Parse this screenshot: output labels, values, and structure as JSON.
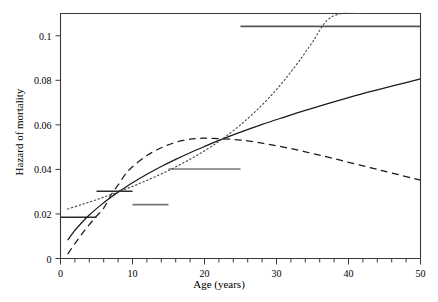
{
  "chart_data": {
    "type": "line",
    "title": "",
    "xlabel": "Age (years)",
    "ylabel": "Hazard of mortality",
    "xlim": [
      0,
      50
    ],
    "ylim": [
      0,
      0.11
    ],
    "grid": false,
    "legend": "none",
    "xticks": [
      0,
      10,
      20,
      30,
      40,
      50
    ],
    "xtick_labels": [
      "0",
      "10",
      "20",
      "30",
      "40",
      "50"
    ],
    "xminor_step": 2,
    "yticks": [
      0,
      0.02,
      0.04,
      0.06,
      0.08,
      0.1
    ],
    "ytick_labels": [
      "0",
      "0.02",
      "0.04",
      "0.06",
      "0.08",
      "0.1"
    ],
    "series": [
      {
        "name": "solid-curve",
        "style": "solid",
        "color": "#1a1a1a",
        "x": [
          1,
          2,
          3,
          4,
          5,
          6,
          7,
          8,
          9,
          10,
          12,
          14,
          16,
          18,
          20,
          22,
          25,
          28,
          31,
          34,
          37,
          40,
          43,
          46,
          50
        ],
        "y": [
          0.0083,
          0.0126,
          0.0163,
          0.0195,
          0.0224,
          0.025,
          0.0275,
          0.0298,
          0.0319,
          0.034,
          0.0378,
          0.0413,
          0.0445,
          0.0475,
          0.0503,
          0.053,
          0.0567,
          0.0602,
          0.0634,
          0.0665,
          0.0694,
          0.0722,
          0.0749,
          0.0774,
          0.0806
        ]
      },
      {
        "name": "dashed-curve",
        "style": "dashed",
        "color": "#1a1a1a",
        "x": [
          1,
          2,
          3,
          4,
          5,
          6,
          7,
          8,
          9,
          10,
          12,
          14,
          16,
          18,
          19,
          20,
          22,
          25,
          28,
          31,
          34,
          37,
          40,
          43,
          46,
          50
        ],
        "y": [
          0.002,
          0.0067,
          0.0111,
          0.0152,
          0.019,
          0.0226,
          0.0285,
          0.033,
          0.0378,
          0.0412,
          0.0462,
          0.0497,
          0.0522,
          0.0536,
          0.0539,
          0.054,
          0.0538,
          0.0532,
          0.0518,
          0.05,
          0.0479,
          0.0456,
          0.0432,
          0.0408,
          0.0384,
          0.0352
        ]
      },
      {
        "name": "dotted-curve",
        "style": "dotted",
        "color": "#4d4d4d",
        "x": [
          1,
          3,
          5,
          7,
          9,
          11,
          13,
          15,
          17,
          19,
          21,
          23,
          25,
          27,
          29,
          31,
          33,
          35,
          37,
          39,
          41,
          42
        ],
        "y": [
          0.0222,
          0.0243,
          0.0264,
          0.0287,
          0.0311,
          0.0337,
          0.0365,
          0.0395,
          0.0428,
          0.0464,
          0.0504,
          0.0549,
          0.06,
          0.0658,
          0.0723,
          0.0797,
          0.088,
          0.0972,
          0.1069,
          0.11,
          0.11,
          0.11
        ]
      }
    ],
    "step_segments": [
      {
        "name": "step-0-5",
        "x0": 0,
        "x1": 5,
        "y": 0.0185,
        "color": "#2b2b2b"
      },
      {
        "name": "step-5-10",
        "x0": 5,
        "x1": 10,
        "y": 0.0302,
        "color": "#2b2b2b"
      },
      {
        "name": "step-10-15",
        "x0": 10,
        "x1": 15,
        "y": 0.0242,
        "color": "#777777"
      },
      {
        "name": "step-15-25",
        "x0": 15,
        "x1": 25,
        "y": 0.0402,
        "color": "#777777"
      },
      {
        "name": "step-25-50",
        "x0": 25,
        "x1": 50,
        "y": 0.1042,
        "color": "#555555"
      }
    ]
  }
}
